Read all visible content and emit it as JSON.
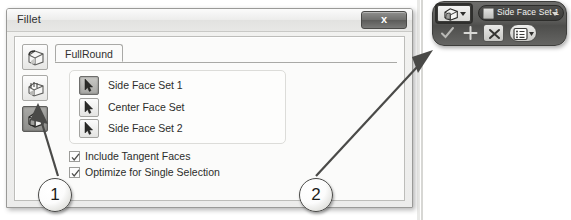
{
  "dialog": {
    "title": "Fillet",
    "close_label": "x",
    "tab": {
      "label": "FullRound"
    },
    "rail": {
      "items": [
        {
          "name": "edge-fillet-icon",
          "selected": false
        },
        {
          "name": "face-fillet-icon",
          "selected": false
        },
        {
          "name": "full-round-fillet-icon",
          "selected": true
        }
      ]
    },
    "selections": [
      {
        "label": "Side Face Set 1",
        "active": true
      },
      {
        "label": "Center Face Set",
        "active": false
      },
      {
        "label": "Side Face Set 2",
        "active": false
      }
    ],
    "options": [
      {
        "label": "Include Tangent Faces",
        "checked": true
      },
      {
        "label": "Optimize for Single Selection",
        "checked": true
      }
    ]
  },
  "minibar": {
    "mode_icon": "full-round-fillet-icon",
    "pill_label": "Side Face Set 1",
    "buttons": [
      {
        "name": "accept-check-button",
        "glyph": "check"
      },
      {
        "name": "add-plus-button",
        "glyph": "plus"
      },
      {
        "name": "cancel-x-button",
        "glyph": "x"
      },
      {
        "name": "options-list-button",
        "glyph": "list"
      }
    ]
  },
  "callouts": [
    {
      "id": "1",
      "label": "1"
    },
    {
      "id": "2",
      "label": "2"
    }
  ],
  "colors": {
    "dialog_bg": "#f2f2f0",
    "panel_bg": "#fbfbfa",
    "border": "#9a9a98",
    "minibar_bg": "#5a5a58",
    "text": "#2c2d2b",
    "callout_outline": "#4a4a48"
  }
}
